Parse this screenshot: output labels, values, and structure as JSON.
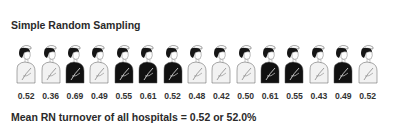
{
  "title": "Simple Random Sampling",
  "figures": [
    {
      "value": "0.52",
      "uniform": "light"
    },
    {
      "value": "0.36",
      "uniform": "light"
    },
    {
      "value": "0.69",
      "uniform": "dark"
    },
    {
      "value": "0.49",
      "uniform": "light"
    },
    {
      "value": "0.55",
      "uniform": "dark"
    },
    {
      "value": "0.61",
      "uniform": "dark"
    },
    {
      "value": "0.52",
      "uniform": "dark"
    },
    {
      "value": "0.48",
      "uniform": "light"
    },
    {
      "value": "0.42",
      "uniform": "light"
    },
    {
      "value": "0.50",
      "uniform": "light"
    },
    {
      "value": "0.61",
      "uniform": "dark"
    },
    {
      "value": "0.55",
      "uniform": "dark"
    },
    {
      "value": "0.43",
      "uniform": "light"
    },
    {
      "value": "0.49",
      "uniform": "dark"
    },
    {
      "value": "0.52",
      "uniform": "light"
    }
  ],
  "summary": "Mean RN turnover of all hospitals = 0.52 or 52.0%",
  "colors": {
    "dark": "#111111",
    "light": "#f2f2f2",
    "outline": "#555555",
    "hair": "#151515"
  }
}
